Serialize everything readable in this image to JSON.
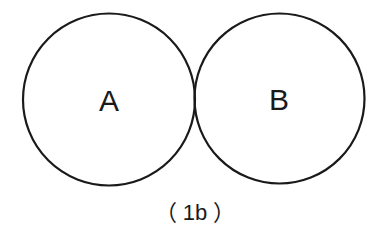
{
  "diagram": {
    "circles": [
      {
        "id": "A",
        "label": "A",
        "cx": 109,
        "cy": 99,
        "r": 86
      },
      {
        "id": "B",
        "label": "B",
        "cx": 279,
        "cy": 98,
        "r": 85
      }
    ],
    "caption": "（ 1b ）",
    "stroke_color": "#1a1a1a"
  }
}
